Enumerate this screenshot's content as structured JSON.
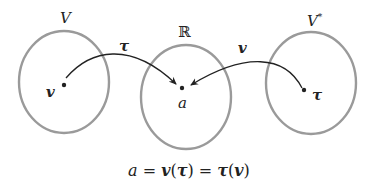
{
  "diagram": {
    "sets": [
      {
        "id": "V",
        "label": "V",
        "point_label": "v"
      },
      {
        "id": "R",
        "label": "ℝ",
        "point_label": "a"
      },
      {
        "id": "Vstar",
        "label": "V",
        "label_sup": "*",
        "point_label": "τ"
      }
    ],
    "arrows": [
      {
        "from": "v",
        "to": "a",
        "label": "τ"
      },
      {
        "from": "τ",
        "to": "a",
        "label": "v"
      }
    ],
    "equation": {
      "a": "a",
      "eq1": "=",
      "v1": "v",
      "lp1": "(",
      "t1": "τ",
      "rp1": ")",
      "eq2": "=",
      "t2": "τ",
      "lp2": "(",
      "v2": "v",
      "rp2": ")"
    },
    "colors": {
      "circle": "#9a9a9a",
      "ink": "#222222"
    }
  }
}
